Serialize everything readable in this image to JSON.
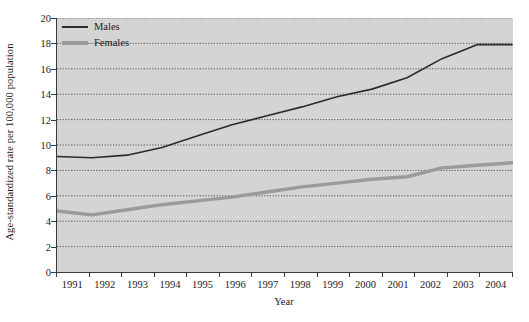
{
  "chart_data": {
    "type": "line",
    "title": "",
    "xlabel": "Year",
    "ylabel": "Age-standardized rate per 100,000 population",
    "categories": [
      "1991",
      "1992",
      "1993",
      "1994",
      "1995",
      "1996",
      "1997",
      "1998",
      "1999",
      "2000",
      "2001",
      "2002",
      "2003",
      "2004"
    ],
    "x": [
      1991,
      1992,
      1993,
      1994,
      1995,
      1996,
      1997,
      1998,
      1999,
      2000,
      2001,
      2002,
      2003,
      2004
    ],
    "ylim": [
      0,
      20
    ],
    "xlim": [
      1991,
      2004
    ],
    "yticks": [
      0,
      2,
      4,
      6,
      8,
      10,
      12,
      14,
      16,
      18,
      20
    ],
    "ytick_labels": [
      "0",
      "2",
      "4",
      "6",
      "8",
      "10",
      "12",
      "14",
      "16",
      "18",
      "20"
    ],
    "grid": "horizontal-dotted",
    "legend_position": "top-left",
    "series": [
      {
        "name": "Males",
        "color": "#2b2b2b",
        "width": 1.6,
        "values": [
          9.1,
          9.0,
          9.2,
          9.8,
          10.7,
          11.6,
          12.3,
          13.0,
          13.8,
          14.4,
          15.3,
          16.8,
          17.9,
          17.9
        ]
      },
      {
        "name": "Females",
        "color": "#9a9a9a",
        "width": 3.4,
        "values": [
          4.8,
          4.5,
          4.9,
          5.3,
          5.6,
          5.9,
          6.3,
          6.7,
          7.0,
          7.3,
          7.5,
          8.2,
          8.4,
          8.6
        ]
      }
    ]
  },
  "legend": {
    "items": [
      {
        "label": "Males",
        "key": "males"
      },
      {
        "label": "Females",
        "key": "females"
      }
    ]
  },
  "colors": {
    "plot_background": "#d4d4d4",
    "axis": "#3a3a3a",
    "gridline": "#555555",
    "males": "#2b2b2b",
    "females": "#9a9a9a",
    "text": "#1a1a1a"
  }
}
